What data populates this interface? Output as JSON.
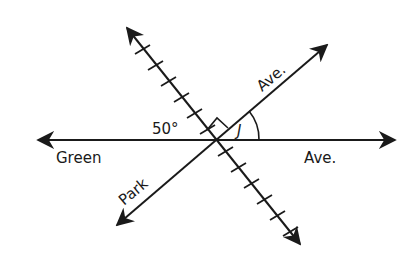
{
  "diagram": {
    "streets": {
      "green_ave_left": "Green",
      "green_ave_right": "Ave.",
      "park_ave_lower": "Park",
      "park_ave_upper": "Ave."
    },
    "angles": {
      "given_angle": "50°",
      "unknown_angle": "J",
      "right_angle_marker": "right-angle"
    },
    "colors": {
      "line": "#1a1a1a",
      "background": "#ffffff"
    }
  }
}
